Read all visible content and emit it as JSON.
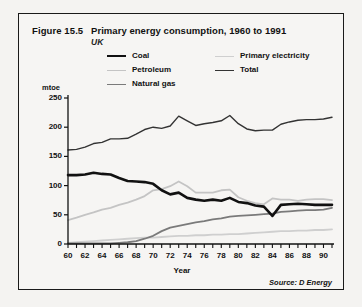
{
  "figure": {
    "number": "Figure 15.5",
    "title": "Primary energy consumption, 1960 to 1991",
    "subtitle": "UK",
    "source": "Source: D Energy"
  },
  "colors": {
    "coal": "#111111",
    "total": "#333333",
    "petroleum": "#c4c4c4",
    "natural_gas": "#7a7a7a",
    "primary_electricity": "#cfcfcf",
    "axis": "#111111",
    "background": "#f6f5f3",
    "border": "#1a1a1a"
  },
  "legend": {
    "position": "top",
    "items": [
      {
        "key": "coal",
        "label": "Coal",
        "color": "#111111",
        "width": 2.6
      },
      {
        "key": "petroleum",
        "label": "Petroleum",
        "color": "#c4c4c4",
        "width": 1.8
      },
      {
        "key": "natural_gas",
        "label": "Natural gas",
        "color": "#7a7a7a",
        "width": 1.8
      },
      {
        "key": "primary_electricity",
        "label": "Primary  electricity",
        "color": "#cfcfcf",
        "width": 1.8
      },
      {
        "key": "total",
        "label": "Total",
        "color": "#333333",
        "width": 1.4
      }
    ]
  },
  "chart_data": {
    "type": "line",
    "title": "Primary energy consumption, 1960 to 1991",
    "subtitle": "UK",
    "xlabel": "Year",
    "ylabel": "mtoe",
    "ylim": [
      0,
      250
    ],
    "xlim": [
      60,
      91
    ],
    "grid": false,
    "ytick_labels": [
      "0",
      "50",
      "100",
      "150",
      "200",
      "250"
    ],
    "ytick_values": [
      0,
      50,
      100,
      150,
      200,
      250
    ],
    "xtick_labels": [
      "60",
      "62",
      "64",
      "66",
      "68",
      "70",
      "72",
      "74",
      "76",
      "78",
      "80",
      "82",
      "84",
      "86",
      "88",
      "90"
    ],
    "xtick_values": [
      60,
      62,
      64,
      66,
      68,
      70,
      72,
      74,
      76,
      78,
      80,
      82,
      84,
      86,
      88,
      90
    ],
    "x": [
      60,
      61,
      62,
      63,
      64,
      65,
      66,
      67,
      68,
      69,
      70,
      71,
      72,
      73,
      74,
      75,
      76,
      77,
      78,
      79,
      80,
      81,
      82,
      83,
      84,
      85,
      86,
      87,
      88,
      89,
      90,
      91
    ],
    "series": [
      {
        "name": "Total",
        "color": "#333333",
        "width": 1.4,
        "values": [
          161,
          162,
          166,
          172,
          174,
          180,
          180,
          181,
          188,
          196,
          200,
          198,
          202,
          219,
          211,
          203,
          206,
          208,
          211,
          220,
          206,
          197,
          194,
          195,
          195,
          205,
          209,
          212,
          213,
          213,
          214,
          217
        ]
      },
      {
        "name": "Coal",
        "color": "#111111",
        "width": 2.6,
        "values": [
          118,
          118,
          119,
          122,
          120,
          119,
          113,
          108,
          107,
          106,
          103,
          92,
          85,
          88,
          79,
          76,
          74,
          76,
          74,
          79,
          72,
          70,
          66,
          64,
          48,
          67,
          68,
          69,
          68,
          67,
          67,
          67
        ]
      },
      {
        "name": "Petroleum",
        "color": "#c4c4c4",
        "width": 1.8,
        "values": [
          41,
          45,
          50,
          54,
          59,
          62,
          67,
          71,
          76,
          82,
          92,
          94,
          99,
          107,
          99,
          88,
          88,
          88,
          92,
          93,
          80,
          74,
          70,
          68,
          78,
          76,
          76,
          74,
          76,
          77,
          77,
          75
        ]
      },
      {
        "name": "Natural gas",
        "color": "#7a7a7a",
        "width": 1.8,
        "values": [
          1,
          1,
          1,
          1,
          1,
          1,
          2,
          3,
          5,
          9,
          14,
          22,
          28,
          31,
          34,
          37,
          39,
          42,
          44,
          47,
          48,
          49,
          50,
          51,
          52,
          55,
          56,
          57,
          58,
          58,
          59,
          62
        ]
      },
      {
        "name": "Primary electricity",
        "color": "#cfcfcf",
        "width": 1.8,
        "values": [
          2,
          3,
          4,
          5,
          6,
          7,
          8,
          9,
          10,
          11,
          11,
          12,
          13,
          14,
          14,
          15,
          15,
          16,
          16,
          17,
          17,
          18,
          19,
          20,
          21,
          22,
          22,
          23,
          23,
          24,
          24,
          25
        ]
      }
    ]
  }
}
